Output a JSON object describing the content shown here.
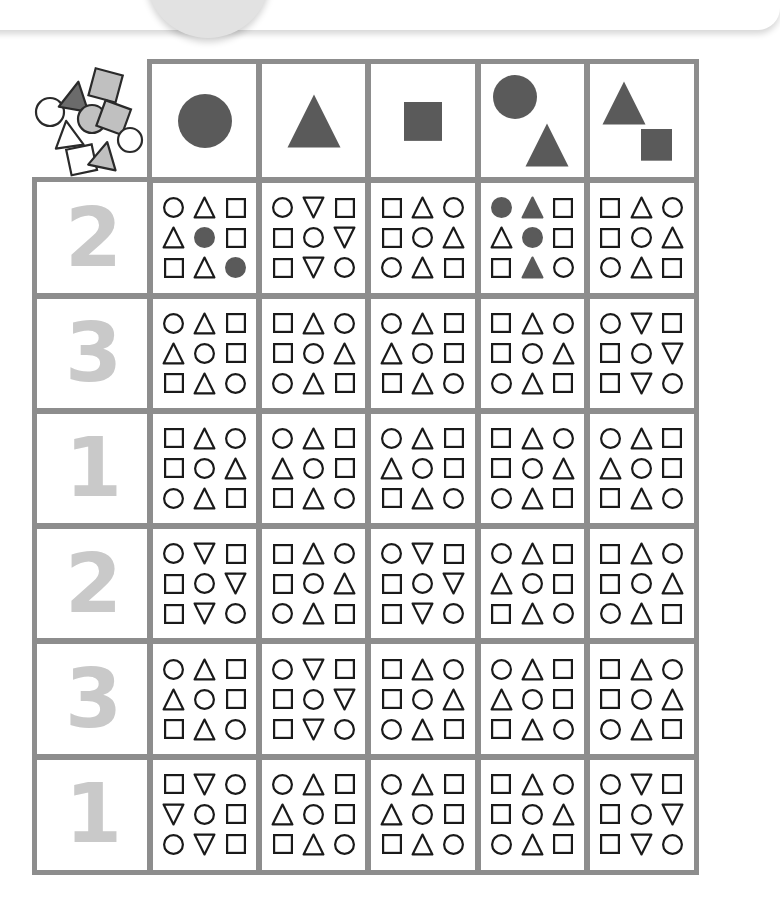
{
  "top_card": {
    "present": true,
    "circle": "decorative-circle"
  },
  "worksheet": {
    "title": "",
    "colors": {
      "grid_line": "#8d8d8d",
      "filled_shape": "#5a5a5a",
      "outline_shape": "#1a1a1a",
      "number_label": "#c9c9c9",
      "scatter_dark": "#6b6b6b",
      "scatter_light": "#c0c0c0"
    },
    "corner": {
      "icon": "scattered-shapes",
      "shapes": [
        {
          "type": "circle",
          "fill": "none"
        },
        {
          "type": "triangle",
          "fill": "dark"
        },
        {
          "type": "square",
          "fill": "light"
        },
        {
          "type": "circle",
          "fill": "light"
        },
        {
          "type": "square",
          "fill": "light"
        },
        {
          "type": "triangle",
          "fill": "none"
        },
        {
          "type": "circle",
          "fill": "none"
        },
        {
          "type": "square",
          "fill": "none"
        },
        {
          "type": "triangle",
          "fill": "light"
        }
      ]
    },
    "column_headers": [
      {
        "id": "col-circle",
        "shapes": [
          "circle"
        ]
      },
      {
        "id": "col-triangle",
        "shapes": [
          "triangle"
        ]
      },
      {
        "id": "col-square",
        "shapes": [
          "square"
        ]
      },
      {
        "id": "col-circle-triangle",
        "shapes": [
          "circle",
          "triangle"
        ]
      },
      {
        "id": "col-triangle-square",
        "shapes": [
          "triangle",
          "square"
        ]
      }
    ],
    "rows": [
      {
        "label": "2",
        "cells": [
          {
            "filled": true,
            "shapes": [
              [
                "circle",
                "triangle",
                "square"
              ],
              [
                "triangle",
                "circle-fill",
                "square"
              ],
              [
                "square",
                "triangle",
                "circle-fill"
              ]
            ]
          },
          {
            "filled": false,
            "shapes": [
              [
                "circle",
                "triangle-down",
                "square"
              ],
              [
                "square",
                "circle",
                "triangle-down"
              ],
              [
                "square",
                "triangle-down",
                "circle"
              ]
            ]
          },
          {
            "filled": false,
            "shapes": [
              [
                "square",
                "triangle",
                "circle"
              ],
              [
                "square",
                "circle",
                "triangle"
              ],
              [
                "circle",
                "triangle",
                "square"
              ]
            ]
          },
          {
            "filled": true,
            "shapes": [
              [
                "circle-fill",
                "triangle-fill",
                "square"
              ],
              [
                "triangle",
                "circle-fill",
                "square"
              ],
              [
                "square",
                "triangle-fill",
                "circle"
              ]
            ]
          },
          {
            "filled": false,
            "shapes": [
              [
                "square",
                "triangle",
                "circle"
              ],
              [
                "square",
                "circle",
                "triangle"
              ],
              [
                "circle",
                "triangle",
                "square"
              ]
            ]
          }
        ]
      },
      {
        "label": "3",
        "cells": [
          {
            "filled": false,
            "shapes": [
              [
                "circle",
                "triangle",
                "square"
              ],
              [
                "triangle",
                "circle",
                "square"
              ],
              [
                "square",
                "triangle",
                "circle"
              ]
            ]
          },
          {
            "filled": false,
            "shapes": [
              [
                "square",
                "triangle",
                "circle"
              ],
              [
                "square",
                "circle",
                "triangle"
              ],
              [
                "circle",
                "triangle",
                "square"
              ]
            ]
          },
          {
            "filled": false,
            "shapes": [
              [
                "circle",
                "triangle",
                "square"
              ],
              [
                "triangle",
                "circle",
                "square"
              ],
              [
                "square",
                "triangle",
                "circle"
              ]
            ]
          },
          {
            "filled": false,
            "shapes": [
              [
                "square",
                "triangle",
                "circle"
              ],
              [
                "square",
                "circle",
                "triangle"
              ],
              [
                "circle",
                "triangle",
                "square"
              ]
            ]
          },
          {
            "filled": false,
            "shapes": [
              [
                "circle",
                "triangle-down",
                "square"
              ],
              [
                "square",
                "circle",
                "triangle-down"
              ],
              [
                "square",
                "triangle-down",
                "circle"
              ]
            ]
          }
        ]
      },
      {
        "label": "1",
        "cells": [
          {
            "filled": false,
            "shapes": [
              [
                "square",
                "triangle",
                "circle"
              ],
              [
                "square",
                "circle",
                "triangle"
              ],
              [
                "circle",
                "triangle",
                "square"
              ]
            ]
          },
          {
            "filled": false,
            "shapes": [
              [
                "circle",
                "triangle",
                "square"
              ],
              [
                "triangle",
                "circle",
                "square"
              ],
              [
                "square",
                "triangle",
                "circle"
              ]
            ]
          },
          {
            "filled": false,
            "shapes": [
              [
                "circle",
                "triangle",
                "square"
              ],
              [
                "triangle",
                "circle",
                "square"
              ],
              [
                "square",
                "triangle",
                "circle"
              ]
            ]
          },
          {
            "filled": false,
            "shapes": [
              [
                "square",
                "triangle",
                "circle"
              ],
              [
                "square",
                "circle",
                "triangle"
              ],
              [
                "circle",
                "triangle",
                "square"
              ]
            ]
          },
          {
            "filled": false,
            "shapes": [
              [
                "circle",
                "triangle",
                "square"
              ],
              [
                "triangle",
                "circle",
                "square"
              ],
              [
                "square",
                "triangle",
                "circle"
              ]
            ]
          }
        ]
      },
      {
        "label": "2",
        "cells": [
          {
            "filled": false,
            "shapes": [
              [
                "circle",
                "triangle-down",
                "square"
              ],
              [
                "square",
                "circle",
                "triangle-down"
              ],
              [
                "square",
                "triangle-down",
                "circle"
              ]
            ]
          },
          {
            "filled": false,
            "shapes": [
              [
                "square",
                "triangle",
                "circle"
              ],
              [
                "square",
                "circle",
                "triangle"
              ],
              [
                "circle",
                "triangle",
                "square"
              ]
            ]
          },
          {
            "filled": false,
            "shapes": [
              [
                "circle",
                "triangle-down",
                "square"
              ],
              [
                "square",
                "circle",
                "triangle-down"
              ],
              [
                "square",
                "triangle-down",
                "circle"
              ]
            ]
          },
          {
            "filled": false,
            "shapes": [
              [
                "circle",
                "triangle",
                "square"
              ],
              [
                "triangle",
                "circle",
                "square"
              ],
              [
                "square",
                "triangle",
                "circle"
              ]
            ]
          },
          {
            "filled": false,
            "shapes": [
              [
                "square",
                "triangle",
                "circle"
              ],
              [
                "square",
                "circle",
                "triangle"
              ],
              [
                "circle",
                "triangle",
                "square"
              ]
            ]
          }
        ]
      },
      {
        "label": "3",
        "cells": [
          {
            "filled": false,
            "shapes": [
              [
                "circle",
                "triangle",
                "square"
              ],
              [
                "triangle",
                "circle",
                "square"
              ],
              [
                "square",
                "triangle",
                "circle"
              ]
            ]
          },
          {
            "filled": false,
            "shapes": [
              [
                "circle",
                "triangle-down",
                "square"
              ],
              [
                "square",
                "circle",
                "triangle-down"
              ],
              [
                "square",
                "triangle-down",
                "circle"
              ]
            ]
          },
          {
            "filled": false,
            "shapes": [
              [
                "square",
                "triangle",
                "circle"
              ],
              [
                "square",
                "circle",
                "triangle"
              ],
              [
                "circle",
                "triangle",
                "square"
              ]
            ]
          },
          {
            "filled": false,
            "shapes": [
              [
                "circle",
                "triangle",
                "square"
              ],
              [
                "triangle",
                "circle",
                "square"
              ],
              [
                "square",
                "triangle",
                "circle"
              ]
            ]
          },
          {
            "filled": false,
            "shapes": [
              [
                "square",
                "triangle",
                "circle"
              ],
              [
                "square",
                "circle",
                "triangle"
              ],
              [
                "circle",
                "triangle",
                "square"
              ]
            ]
          }
        ]
      },
      {
        "label": "1",
        "cells": [
          {
            "filled": false,
            "shapes": [
              [
                "square",
                "triangle-down",
                "circle"
              ],
              [
                "triangle-down",
                "circle",
                "square"
              ],
              [
                "circle",
                "triangle-down",
                "square"
              ]
            ]
          },
          {
            "filled": false,
            "shapes": [
              [
                "circle",
                "triangle",
                "square"
              ],
              [
                "triangle",
                "circle",
                "square"
              ],
              [
                "square",
                "triangle",
                "circle"
              ]
            ]
          },
          {
            "filled": false,
            "shapes": [
              [
                "circle",
                "triangle",
                "square"
              ],
              [
                "triangle",
                "circle",
                "square"
              ],
              [
                "square",
                "triangle",
                "circle"
              ]
            ]
          },
          {
            "filled": false,
            "shapes": [
              [
                "square",
                "triangle",
                "circle"
              ],
              [
                "square",
                "circle",
                "triangle"
              ],
              [
                "circle",
                "triangle",
                "square"
              ]
            ]
          },
          {
            "filled": false,
            "shapes": [
              [
                "circle",
                "triangle-down",
                "square"
              ],
              [
                "square",
                "circle",
                "triangle-down"
              ],
              [
                "square",
                "triangle-down",
                "circle"
              ]
            ]
          }
        ]
      }
    ]
  }
}
